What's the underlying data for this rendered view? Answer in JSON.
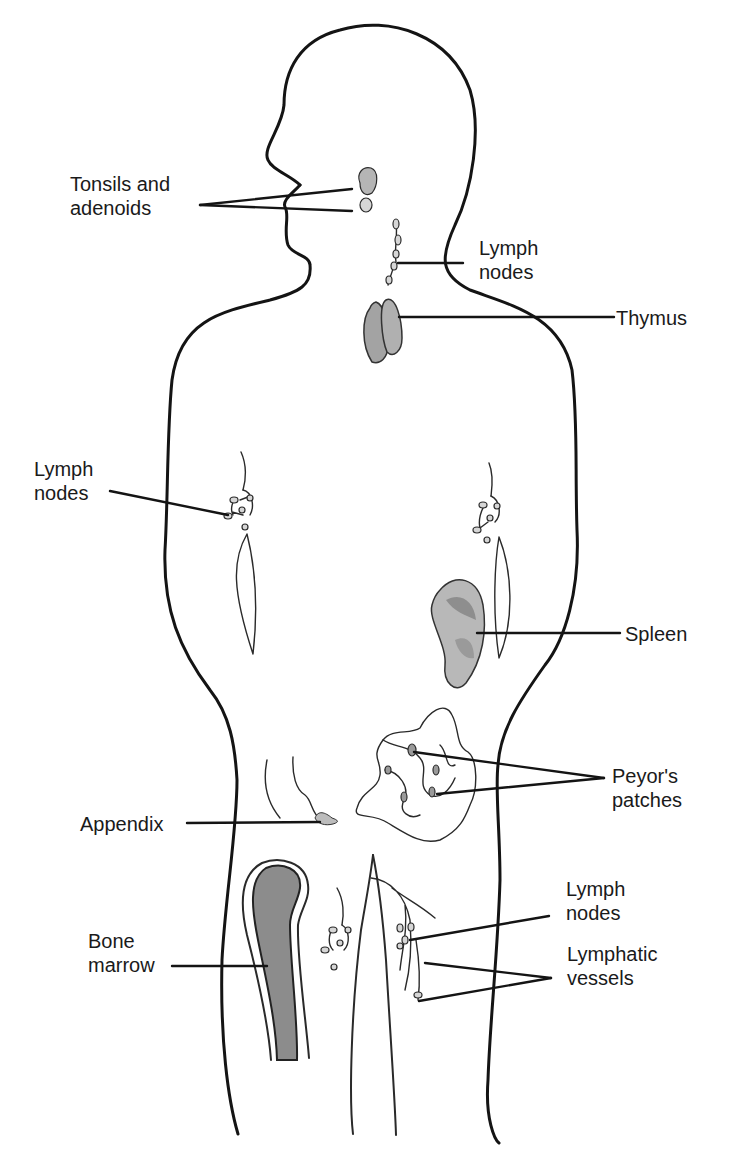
{
  "diagram": {
    "labels": {
      "tonsils": {
        "line1": "Tonsils and",
        "line2": "adenoids"
      },
      "lymph_nodes_neck": {
        "line1": "Lymph",
        "line2": "nodes"
      },
      "thymus": {
        "line1": "Thymus"
      },
      "lymph_nodes_axilla": {
        "line1": "Lymph",
        "line2": "nodes"
      },
      "spleen": {
        "line1": "Spleen"
      },
      "peyers_patches": {
        "line1": "Peyor's",
        "line2": "patches"
      },
      "appendix": {
        "line1": "Appendix"
      },
      "lymph_nodes_groin": {
        "line1": "Lymph",
        "line2": "nodes"
      },
      "bone_marrow": {
        "line1": "Bone",
        "line2": "marrow"
      },
      "lymphatic_vessels": {
        "line1": "Lymphatic",
        "line2": "vessels"
      }
    },
    "colors": {
      "outline": "#141414",
      "organ_fill": "#a8a8a8",
      "bone_marrow_fill": "#8c8c8c",
      "background": "#ffffff"
    }
  }
}
